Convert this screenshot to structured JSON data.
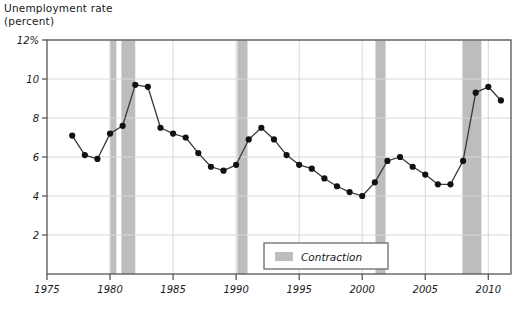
{
  "chart_data": {
    "type": "line",
    "title": "Unemployment rate\n(percent)",
    "ylabel": "Unemployment rate (percent)",
    "xlabel": "",
    "xlim": [
      1975,
      2011.8
    ],
    "ylim": [
      0,
      12
    ],
    "grid": true,
    "legend_position": "bottom-center",
    "ytick_labels": [
      "2",
      "4",
      "6",
      "8",
      "10",
      "12%"
    ],
    "ytick_values": [
      2,
      4,
      6,
      8,
      10,
      12
    ],
    "xtick_labels": [
      "1975",
      "1980",
      "1985",
      "1990",
      "1995",
      "2000",
      "2005",
      "2010"
    ],
    "xtick_values": [
      1975,
      1980,
      1985,
      1990,
      1995,
      2000,
      2005,
      2010
    ],
    "series": [
      {
        "name": "Unemployment rate",
        "marker": "filled-circle",
        "color": "#3a3a3a",
        "x": [
          1977,
          1978,
          1979,
          1980,
          1981,
          1982,
          1983,
          1984,
          1985,
          1986,
          1987,
          1988,
          1989,
          1990,
          1991,
          1992,
          1993,
          1994,
          1995,
          1996,
          1997,
          1998,
          1999,
          2000,
          2001,
          2002,
          2003,
          2004,
          2005,
          2006,
          2007,
          2008,
          2009,
          2010,
          2011
        ],
        "values": [
          7.1,
          6.1,
          5.9,
          7.2,
          7.6,
          9.7,
          9.6,
          7.5,
          7.2,
          7.0,
          6.2,
          5.5,
          5.3,
          5.6,
          6.9,
          7.5,
          6.9,
          6.1,
          5.6,
          5.4,
          4.9,
          4.5,
          4.2,
          4.0,
          4.7,
          5.8,
          6.0,
          5.5,
          5.1,
          4.6,
          4.6,
          5.8,
          9.3,
          9.6,
          8.9
        ]
      }
    ],
    "bands": [
      {
        "label": "Contraction",
        "start": 1980.0,
        "end": 1980.5
      },
      {
        "label": "Contraction",
        "start": 1980.9,
        "end": 1982.0
      },
      {
        "label": "Contraction",
        "start": 1990.1,
        "end": 1990.9
      },
      {
        "label": "Contraction",
        "start": 2001.05,
        "end": 2001.85
      },
      {
        "label": "Contraction",
        "start": 2007.95,
        "end": 2009.45
      }
    ],
    "legend": [
      {
        "label": "Contraction",
        "swatch_color": "#bdbdbd"
      }
    ],
    "colors": {
      "band": "#bdbdbd",
      "line": "#3a3a3a",
      "marker": "#111111",
      "grid": "#d8d8d8",
      "axis": "#555555",
      "text": "#1a1a1a",
      "background": "#ffffff"
    }
  }
}
